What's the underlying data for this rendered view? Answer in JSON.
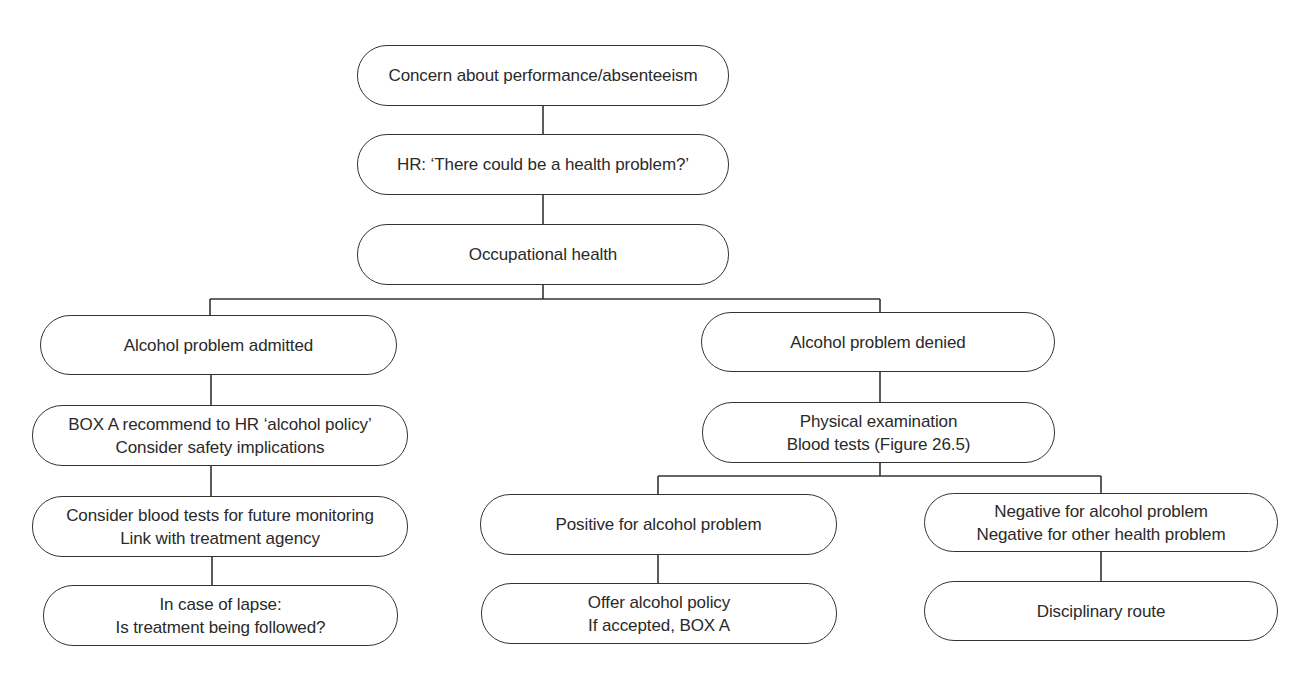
{
  "diagram": {
    "type": "flowchart",
    "nodes": {
      "concern": {
        "lines": [
          "Concern about performance/absenteeism"
        ]
      },
      "hr": {
        "lines": [
          "HR: ‘There could be a health problem?’"
        ]
      },
      "occ_health": {
        "lines": [
          "Occupational health"
        ]
      },
      "admitted": {
        "lines": [
          "Alcohol problem admitted"
        ]
      },
      "box_a": {
        "lines": [
          "BOX A recommend to HR ‘alcohol policy’",
          "Consider safety implications"
        ]
      },
      "blood_monitor": {
        "lines": [
          "Consider blood tests for future monitoring",
          "Link with treatment agency"
        ]
      },
      "lapse": {
        "lines": [
          "In case of lapse:",
          "Is treatment being followed?"
        ]
      },
      "denied": {
        "lines": [
          "Alcohol problem denied"
        ]
      },
      "physical": {
        "lines": [
          "Physical examination",
          "Blood tests (Figure 26.5)"
        ]
      },
      "positive": {
        "lines": [
          "Positive for alcohol problem"
        ]
      },
      "offer": {
        "lines": [
          "Offer alcohol policy",
          "If accepted, BOX A"
        ]
      },
      "negative": {
        "lines": [
          "Negative for alcohol problem",
          "Negative for other health problem"
        ]
      },
      "disciplinary": {
        "lines": [
          "Disciplinary route"
        ]
      }
    },
    "edges": [
      [
        "concern",
        "hr"
      ],
      [
        "hr",
        "occ_health"
      ],
      [
        "occ_health",
        "admitted"
      ],
      [
        "occ_health",
        "denied"
      ],
      [
        "admitted",
        "box_a"
      ],
      [
        "box_a",
        "blood_monitor"
      ],
      [
        "blood_monitor",
        "lapse"
      ],
      [
        "denied",
        "physical"
      ],
      [
        "physical",
        "positive"
      ],
      [
        "physical",
        "negative"
      ],
      [
        "positive",
        "offer"
      ],
      [
        "negative",
        "disciplinary"
      ]
    ]
  }
}
